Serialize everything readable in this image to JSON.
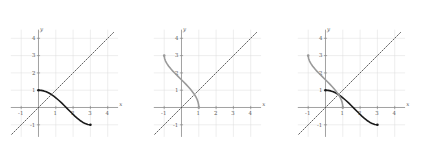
{
  "figure": {
    "title": "",
    "panel_count": 3,
    "background": "#ffffff"
  },
  "colors": {
    "function_curve": "#1a1a1a",
    "inverse_curve": "#9a9a9a",
    "identity_line": "#3a3a3a",
    "axis": "#8a8a8a",
    "grid": "#dcdcdc",
    "tick_text": "#5a5a5a"
  },
  "axes": {
    "xlabel": "x",
    "ylabel": "y",
    "xlim": [
      -1.6,
      4.6
    ],
    "ylim": [
      -1.7,
      4.5
    ],
    "xticks": [
      -1,
      1,
      2,
      3,
      4
    ],
    "xtick_labels": [
      "-1",
      "1",
      "2",
      "3",
      "4"
    ],
    "yticks": [
      -1,
      1,
      2,
      3,
      4
    ],
    "ytick_labels": [
      "-1",
      "1",
      "2",
      "3",
      "4"
    ],
    "grid": true,
    "grid_x": [
      -1,
      1,
      2,
      3,
      4
    ],
    "grid_y": [
      -1,
      1,
      2,
      3,
      4
    ]
  },
  "chart_data": [
    {
      "type": "line",
      "title": "",
      "panel": 1,
      "xlabel": "x",
      "ylabel": "y",
      "xlim": [
        -1.6,
        4.6
      ],
      "ylim": [
        -1.7,
        4.5
      ],
      "grid": true,
      "legend": "none",
      "series": [
        {
          "name": "identity-line",
          "style": "dotted",
          "color": "#3a3a3a",
          "x": [
            -1.55,
            4.4
          ],
          "y": [
            -1.55,
            4.4
          ]
        },
        {
          "name": "f",
          "style": "solid",
          "color": "#1a1a1a",
          "endpoint_markers": [
            [
              0,
              1
            ],
            [
              3,
              -1
            ]
          ],
          "x": [
            0.0,
            0.15,
            0.3,
            0.45,
            0.6,
            0.75,
            0.9,
            1.05,
            1.2,
            1.35,
            1.5,
            1.65,
            1.8,
            1.95,
            2.1,
            2.25,
            2.4,
            2.55,
            2.7,
            2.85,
            3.0
          ],
          "y": [
            1.0,
            0.99,
            0.96,
            0.91,
            0.84,
            0.75,
            0.64,
            0.52,
            0.39,
            0.25,
            0.1,
            -0.05,
            -0.2,
            -0.35,
            -0.5,
            -0.63,
            -0.75,
            -0.85,
            -0.93,
            -0.98,
            -1.0
          ]
        }
      ]
    },
    {
      "type": "line",
      "title": "",
      "panel": 2,
      "xlabel": "x",
      "ylabel": "y",
      "xlim": [
        -1.6,
        4.6
      ],
      "ylim": [
        -1.7,
        4.5
      ],
      "grid": true,
      "legend": "none",
      "series": [
        {
          "name": "identity-line",
          "style": "dotted",
          "color": "#3a3a3a",
          "x": [
            -1.55,
            4.4
          ],
          "y": [
            -1.55,
            4.4
          ]
        },
        {
          "name": "f-inverse",
          "style": "solid",
          "color": "#9a9a9a",
          "endpoint_markers": [
            [
              1,
              0
            ],
            [
              -1,
              3
            ]
          ],
          "x": [
            1.0,
            0.99,
            0.96,
            0.91,
            0.84,
            0.75,
            0.64,
            0.52,
            0.39,
            0.25,
            0.1,
            -0.05,
            -0.2,
            -0.35,
            -0.5,
            -0.63,
            -0.75,
            -0.85,
            -0.93,
            -0.98,
            -1.0
          ],
          "y": [
            0.0,
            0.15,
            0.3,
            0.45,
            0.6,
            0.75,
            0.9,
            1.05,
            1.2,
            1.35,
            1.5,
            1.65,
            1.8,
            1.95,
            2.1,
            2.25,
            2.4,
            2.55,
            2.7,
            2.85,
            3.0
          ]
        }
      ]
    },
    {
      "type": "line",
      "title": "",
      "panel": 3,
      "xlabel": "x",
      "ylabel": "y",
      "xlim": [
        -1.6,
        4.6
      ],
      "ylim": [
        -1.7,
        4.5
      ],
      "grid": true,
      "legend": "none",
      "series": [
        {
          "name": "identity-line",
          "style": "dotted",
          "color": "#3a3a3a",
          "x": [
            -1.55,
            4.4
          ],
          "y": [
            -1.55,
            4.4
          ]
        },
        {
          "name": "f",
          "style": "solid",
          "color": "#1a1a1a",
          "endpoint_markers": [
            [
              0,
              1
            ],
            [
              3,
              -1
            ]
          ],
          "x": [
            0.0,
            0.15,
            0.3,
            0.45,
            0.6,
            0.75,
            0.9,
            1.05,
            1.2,
            1.35,
            1.5,
            1.65,
            1.8,
            1.95,
            2.1,
            2.25,
            2.4,
            2.55,
            2.7,
            2.85,
            3.0
          ],
          "y": [
            1.0,
            0.99,
            0.96,
            0.91,
            0.84,
            0.75,
            0.64,
            0.52,
            0.39,
            0.25,
            0.1,
            -0.05,
            -0.2,
            -0.35,
            -0.5,
            -0.63,
            -0.75,
            -0.85,
            -0.93,
            -0.98,
            -1.0
          ]
        },
        {
          "name": "f-inverse",
          "style": "solid",
          "color": "#9a9a9a",
          "endpoint_markers": [
            [
              1,
              0
            ],
            [
              -1,
              3
            ]
          ],
          "x": [
            1.0,
            0.99,
            0.96,
            0.91,
            0.84,
            0.75,
            0.64,
            0.52,
            0.39,
            0.25,
            0.1,
            -0.05,
            -0.2,
            -0.35,
            -0.5,
            -0.63,
            -0.75,
            -0.85,
            -0.93,
            -0.98,
            -1.0
          ],
          "y": [
            0.0,
            0.15,
            0.3,
            0.45,
            0.6,
            0.75,
            0.9,
            1.05,
            1.2,
            1.35,
            1.5,
            1.65,
            1.8,
            1.95,
            2.1,
            2.25,
            2.4,
            2.55,
            2.7,
            2.85,
            3.0
          ]
        }
      ]
    }
  ]
}
